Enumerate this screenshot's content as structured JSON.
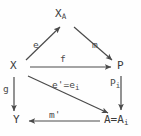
{
  "diagram": {
    "type": "commutative-diagram",
    "background_color": "#fefefe",
    "stroke_color": "#4a4a4a",
    "text_color": "#3a3a3a",
    "nodes": [
      {
        "id": "XA",
        "base": "X",
        "sub": "A",
        "x": 62,
        "y": 14
      },
      {
        "id": "X",
        "base": "X",
        "sub": "",
        "x": 14,
        "y": 66
      },
      {
        "id": "P",
        "base": "P",
        "sub": "",
        "x": 121,
        "y": 66
      },
      {
        "id": "Y",
        "base": "Y",
        "sub": "",
        "x": 18,
        "y": 120
      },
      {
        "id": "A",
        "base": "A=A",
        "sub": "i",
        "x": 116,
        "y": 120
      }
    ],
    "edges": [
      {
        "id": "e",
        "from": "X",
        "to": "XA",
        "base": "e",
        "sub": "",
        "prime": false
      },
      {
        "id": "m",
        "from": "XA",
        "to": "P",
        "base": "m",
        "sub": "",
        "prime": false
      },
      {
        "id": "f",
        "from": "X",
        "to": "P",
        "base": "f",
        "sub": "",
        "prime": false
      },
      {
        "id": "eprime",
        "from": "X",
        "to": "A",
        "base": "e'=e",
        "sub": "i",
        "prime": true
      },
      {
        "id": "pi",
        "from": "P",
        "to": "A",
        "base": "P",
        "sub": "i",
        "prime": false
      },
      {
        "id": "g",
        "from": "X",
        "to": "Y",
        "base": "g",
        "sub": "",
        "prime": false
      },
      {
        "id": "mprime",
        "from": "A",
        "to": "Y",
        "base": "m'",
        "sub": "",
        "prime": true
      }
    ]
  }
}
